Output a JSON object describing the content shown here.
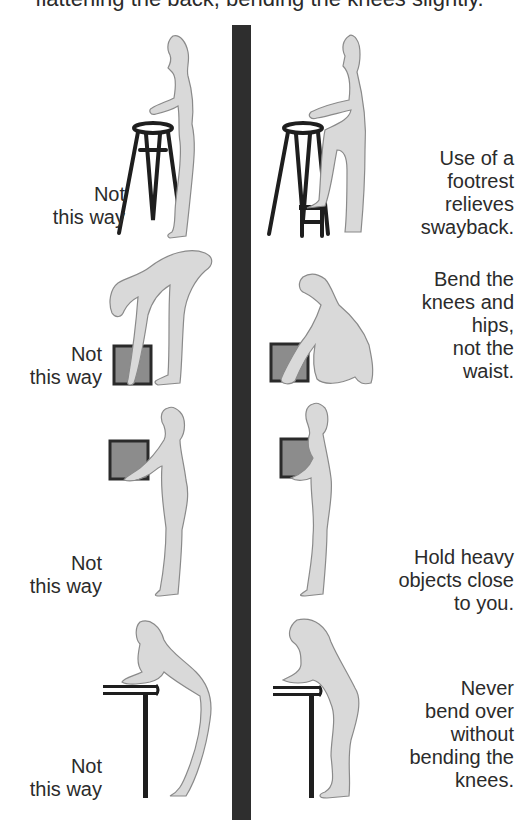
{
  "header": {
    "caption_fragment": "flattening the back, bending the knees slightly."
  },
  "colors": {
    "divider": "#2e2e2e",
    "figure_fill": "#d9d9d9",
    "box_fill": "#8c8c8c",
    "furniture": "#1e1e1e",
    "text": "#2b2b2b"
  },
  "rows": [
    {
      "id": "standing-at-stool",
      "left_caption": [
        "Not",
        "this way"
      ],
      "right_caption": [
        "Use of a",
        "footrest",
        "relieves",
        "swayback."
      ],
      "left_scene": "woman standing upright with hands on tall stool, swayback posture",
      "right_scene": "woman standing at stool with one foot raised on small footrest"
    },
    {
      "id": "lifting-box",
      "left_caption": [
        "Not",
        "this way"
      ],
      "right_caption": [
        "Bend the",
        "knees and",
        "hips,",
        "not the",
        "waist."
      ],
      "left_scene": "woman bending at waist with straight legs to reach box on floor",
      "right_scene": "woman squatting with bent knees and hips to lift box"
    },
    {
      "id": "holding-box",
      "left_caption": [
        "Not",
        "this way"
      ],
      "right_caption": [
        "Hold heavy",
        "objects close",
        "to you."
      ],
      "left_scene": "woman holding box at arm's length away from body",
      "right_scene": "woman holding box close against chest"
    },
    {
      "id": "leaning-on-table",
      "left_caption": [
        "Not",
        "this way"
      ],
      "right_caption": [
        "Never",
        "bend over",
        "without",
        "bending the",
        "knees."
      ],
      "left_scene": "woman leaning over table with straight legs, hand on face",
      "right_scene": "woman leaning over table with knees bent"
    }
  ]
}
